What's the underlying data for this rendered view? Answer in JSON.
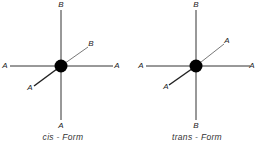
{
  "diagrams": [
    {
      "caption": "cis - Form",
      "center": [
        61,
        66
      ],
      "labels": {
        "top": "B",
        "upper_right": "B",
        "left": "A",
        "right": "A",
        "lower_left": "A",
        "bottom": "A"
      }
    },
    {
      "caption": "trans - Form",
      "center": [
        196,
        66
      ],
      "labels": {
        "top": "B",
        "upper_right": "A",
        "left": "A",
        "right": "A",
        "lower_left": "A",
        "bottom": "B"
      }
    }
  ],
  "colors": {
    "line": "#333333",
    "atom": "#000000",
    "background": "#ffffff"
  }
}
